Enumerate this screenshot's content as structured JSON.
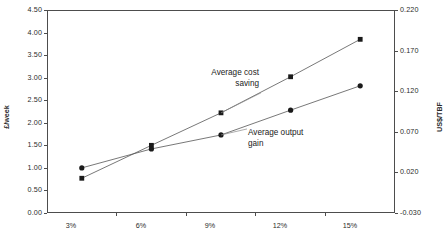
{
  "chart_data": {
    "type": "line",
    "title": "",
    "subtitle": "",
    "xlabel": "",
    "ylabel": "£/week",
    "y2label": "US$/TBF",
    "categories": [
      "3%",
      "6%",
      "9%",
      "12%",
      "15%"
    ],
    "ylim": [
      0.0,
      4.5
    ],
    "yticks": [
      "0.00",
      "0.50",
      "1.00",
      "1.50",
      "2.00",
      "2.50",
      "3.00",
      "3.50",
      "4.00",
      "4.50"
    ],
    "y2lim": [
      -0.03,
      0.22
    ],
    "y2ticks": [
      "-0.030",
      "0.020",
      "0.070",
      "0.120",
      "0.170",
      "0.220"
    ],
    "grid": false,
    "legend_position": "inline-annotations",
    "series": [
      {
        "name": "Average cost saving",
        "marker": "square",
        "color": "#1a1a1a",
        "axis": "left",
        "values": [
          0.77,
          1.5,
          2.22,
          3.02,
          3.85
        ]
      },
      {
        "name": "Average output gain",
        "marker": "circle",
        "color": "#1a1a1a",
        "axis": "left",
        "values": [
          1.0,
          1.42,
          1.73,
          2.28,
          2.82
        ]
      }
    ],
    "annotations": [
      {
        "id": "cost",
        "line1": "Average cost",
        "line2": "saving"
      },
      {
        "id": "output",
        "line1": "Average output",
        "line2": "gain"
      }
    ]
  },
  "axes": {
    "left_title": "£/week",
    "right_title": "US$/TBF",
    "left_ticks": [
      "4.50",
      "4.00",
      "3.50",
      "3.00",
      "2.50",
      "2.00",
      "1.50",
      "1.00",
      "0.50",
      "0.00"
    ],
    "right_ticks": [
      "0.220",
      "0.170",
      "0.120",
      "0.070",
      "0.020",
      "-0.030"
    ],
    "x_ticks": [
      "3%",
      "6%",
      "9%",
      "12%",
      "15%"
    ]
  },
  "annotations": {
    "cost_line1": "Average cost",
    "cost_line2": "saving",
    "output_line1": "Average output",
    "output_line2": "gain"
  },
  "caption": {
    "text": ""
  },
  "colors": {
    "axis": "#4d4d4d",
    "text": "#2b2b2b",
    "series": "#1a1a1a",
    "background": "#ffffff"
  }
}
